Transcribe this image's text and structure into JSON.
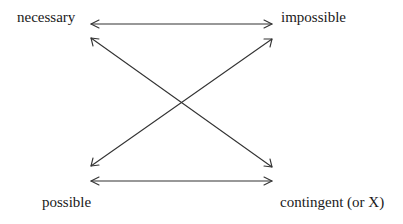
{
  "diagram": {
    "type": "square-of-opposition",
    "nodes": {
      "top_left": "necessary",
      "top_right": "impossible",
      "bottom_left": "possible",
      "bottom_right": "contingent (or X)"
    },
    "edges": [
      {
        "from": "necessary",
        "to": "impossible",
        "style": "double-arrow"
      },
      {
        "from": "possible",
        "to": "contingent (or X)",
        "style": "double-arrow"
      },
      {
        "from": "necessary",
        "to": "contingent (or X)",
        "style": "double-arrow"
      },
      {
        "from": "impossible",
        "to": "possible",
        "style": "double-arrow"
      }
    ],
    "colors": {
      "line": "#333333",
      "text": "#1a1a1a",
      "background": "#ffffff"
    }
  }
}
